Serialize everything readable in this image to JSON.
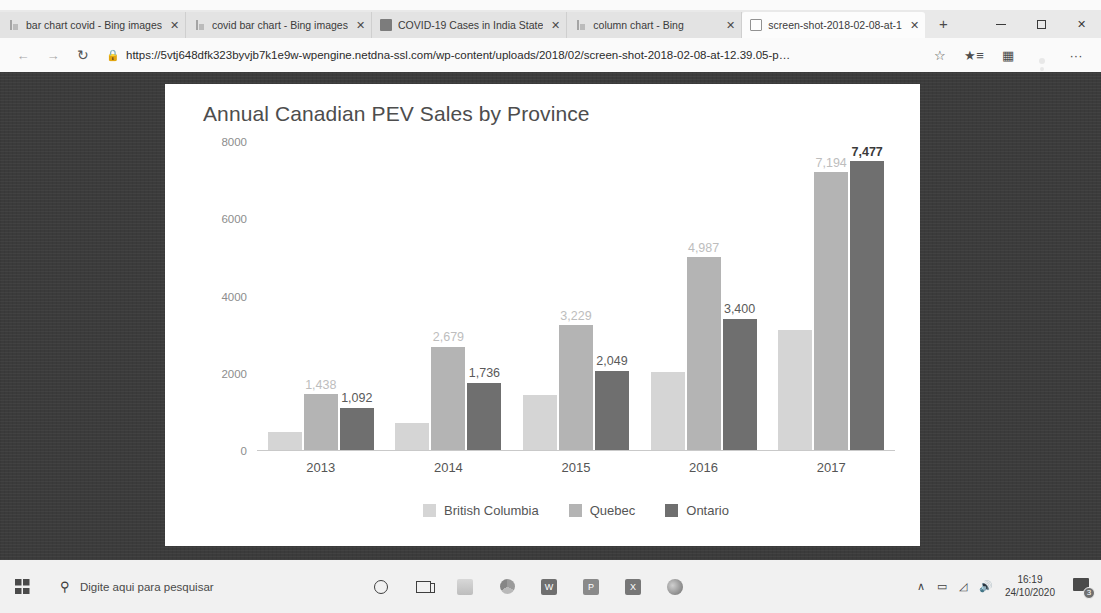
{
  "browser": {
    "tabs": [
      {
        "label": "bar chart covid - Bing images",
        "icon": "bing-icon",
        "active": false
      },
      {
        "label": "covid bar chart - Bing images",
        "icon": "bing-icon",
        "active": false
      },
      {
        "label": "COVID-19 Cases in India State",
        "icon": "covid-site-icon",
        "active": false
      },
      {
        "label": "column chart - Bing",
        "icon": "bing-icon",
        "active": false
      },
      {
        "label": "screen-shot-2018-02-08-at-1",
        "icon": "document-icon",
        "active": true
      }
    ],
    "close_glyph": "✕",
    "new_tab_glyph": "+",
    "window_controls": {
      "minimize": "minimize-icon",
      "maximize": "maximize-icon",
      "close": "✕"
    },
    "nav": {
      "back": "←",
      "forward": "→",
      "refresh": "↻"
    },
    "address": {
      "lock": "🔒",
      "scheme": "https://",
      "host": "5vtj648dfk323byvjb7k1e9w-wpengine.netdna-ssl.com",
      "path": "/wp-content/uploads/2018/02/screen-shot-2018-02-08-at-12.39.05-p…"
    },
    "toolbar": {
      "favorite": "☆",
      "favorites_list": "favorites-list-icon",
      "collections": "collections-icon",
      "profile": "profile-avatar",
      "more": "···"
    }
  },
  "chart_data": {
    "type": "bar",
    "title": "Annual Canadian PEV Sales by Province",
    "xlabel": "",
    "ylabel": "",
    "categories": [
      "2013",
      "2014",
      "2015",
      "2016",
      "2017"
    ],
    "ylim": [
      0,
      8000
    ],
    "yticks": [
      0,
      2000,
      4000,
      6000,
      8000
    ],
    "ytick_labels": [
      "0",
      "2000",
      "4000",
      "6000",
      "8000"
    ],
    "grid": false,
    "legend_position": "bottom",
    "series": [
      {
        "name": "British Columbia",
        "color": "#d5d5d5",
        "values": [
          460,
          700,
          1430,
          2010,
          3100
        ],
        "labels": [
          "",
          "",
          "",
          "",
          ""
        ]
      },
      {
        "name": "Quebec",
        "color": "#b4b4b4",
        "values": [
          1438,
          2679,
          3229,
          4987,
          7194
        ],
        "labels": [
          "1,438",
          "2,679",
          "3,229",
          "4,987",
          "7,194"
        ]
      },
      {
        "name": "Ontario",
        "color": "#6f6f6f",
        "values": [
          1092,
          1736,
          2049,
          3400,
          7477
        ],
        "labels": [
          "1,092",
          "1,736",
          "2,049",
          "3,400",
          "7,477"
        ]
      }
    ]
  },
  "taskbar": {
    "start": "windows-start-icon",
    "search_placeholder": "Digite aqui para pesquisar",
    "search_icon": "search-icon",
    "icons": [
      "cortana-icon",
      "task-view-icon",
      "file-explorer-icon",
      "chrome-icon",
      "word-icon",
      "powerpoint-icon",
      "excel-icon",
      "edge-icon"
    ],
    "icon_letters": {
      "word": "W",
      "powerpoint": "P",
      "excel": "X"
    },
    "tray": {
      "chevron": "∧",
      "network": "network-icon",
      "wifi": "wifi-icon",
      "volume": "volume-icon"
    },
    "clock": {
      "time": "16:19",
      "date": "24/10/2020"
    },
    "notifications": {
      "icon": "notification-icon",
      "count": "3"
    }
  }
}
